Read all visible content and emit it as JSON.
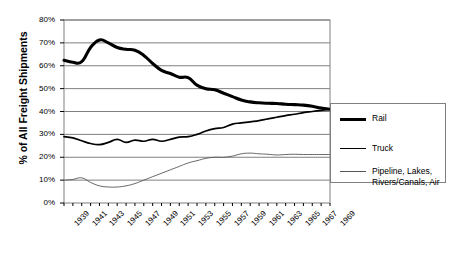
{
  "chart_data": {
    "type": "line",
    "title": "",
    "xlabel": "",
    "ylabel": "% of All Freight Shipments",
    "ylim": [
      0,
      80
    ],
    "ytick_labels": [
      "0%",
      "10%",
      "20%",
      "30%",
      "40%",
      "50%",
      "60%",
      "70%",
      "80%"
    ],
    "ytick_values": [
      0,
      10,
      20,
      30,
      40,
      50,
      60,
      70,
      80
    ],
    "grid": true,
    "legend_position": "right",
    "xlim": [
      1939,
      1969
    ],
    "x": [
      1939,
      1940,
      1941,
      1942,
      1943,
      1944,
      1945,
      1946,
      1947,
      1948,
      1949,
      1950,
      1951,
      1952,
      1953,
      1954,
      1955,
      1956,
      1957,
      1958,
      1959,
      1960,
      1961,
      1962,
      1963,
      1964,
      1965,
      1966,
      1967,
      1968,
      1969
    ],
    "xtick_labels": [
      "1939",
      "1941",
      "1943",
      "1945",
      "1947",
      "1949",
      "1951",
      "1953",
      "1955",
      "1957",
      "1959",
      "1961",
      "1963",
      "1965",
      "1967",
      "1969"
    ],
    "xtick_values": [
      1939,
      1941,
      1943,
      1945,
      1947,
      1949,
      1951,
      1953,
      1955,
      1957,
      1959,
      1961,
      1963,
      1965,
      1967,
      1969
    ],
    "series": [
      {
        "name": "Rail",
        "style": "thick",
        "color": "#000000",
        "values": [
          62.4,
          61.5,
          61.8,
          68.0,
          71.3,
          70.0,
          68.0,
          67.2,
          66.8,
          64.5,
          61.0,
          58.0,
          56.6,
          55.0,
          54.8,
          51.5,
          50.0,
          49.5,
          48.0,
          46.5,
          45.0,
          44.2,
          43.8,
          43.6,
          43.5,
          43.2,
          43.0,
          42.8,
          42.3,
          41.5,
          41.0
        ]
      },
      {
        "name": "Truck",
        "style": "medium",
        "color": "#000000",
        "values": [
          29.0,
          28.5,
          27.2,
          26.0,
          25.5,
          26.5,
          27.8,
          26.5,
          27.5,
          27.0,
          27.8,
          27.0,
          27.8,
          28.8,
          29.0,
          30.0,
          31.5,
          32.5,
          33.0,
          34.5,
          35.0,
          35.5,
          36.0,
          36.8,
          37.5,
          38.2,
          38.8,
          39.5,
          40.0,
          40.5,
          41.0
        ]
      },
      {
        "name": "Pipeline, Lakes,\nRivers/Canals, Air",
        "style": "thin",
        "color": "#555555",
        "values": [
          10.0,
          10.3,
          11.0,
          9.0,
          7.5,
          7.0,
          7.0,
          7.5,
          8.5,
          10.0,
          11.5,
          13.0,
          14.5,
          16.0,
          17.5,
          18.5,
          19.5,
          20.0,
          20.0,
          20.5,
          21.5,
          21.8,
          21.5,
          21.3,
          21.0,
          21.2,
          21.3,
          21.2,
          21.2,
          21.2,
          21.2
        ]
      }
    ]
  },
  "legend": {
    "items": [
      {
        "label": "Rail"
      },
      {
        "label": "Truck"
      },
      {
        "label": "Pipeline, Lakes,\nRivers/Canals, Air"
      }
    ]
  }
}
